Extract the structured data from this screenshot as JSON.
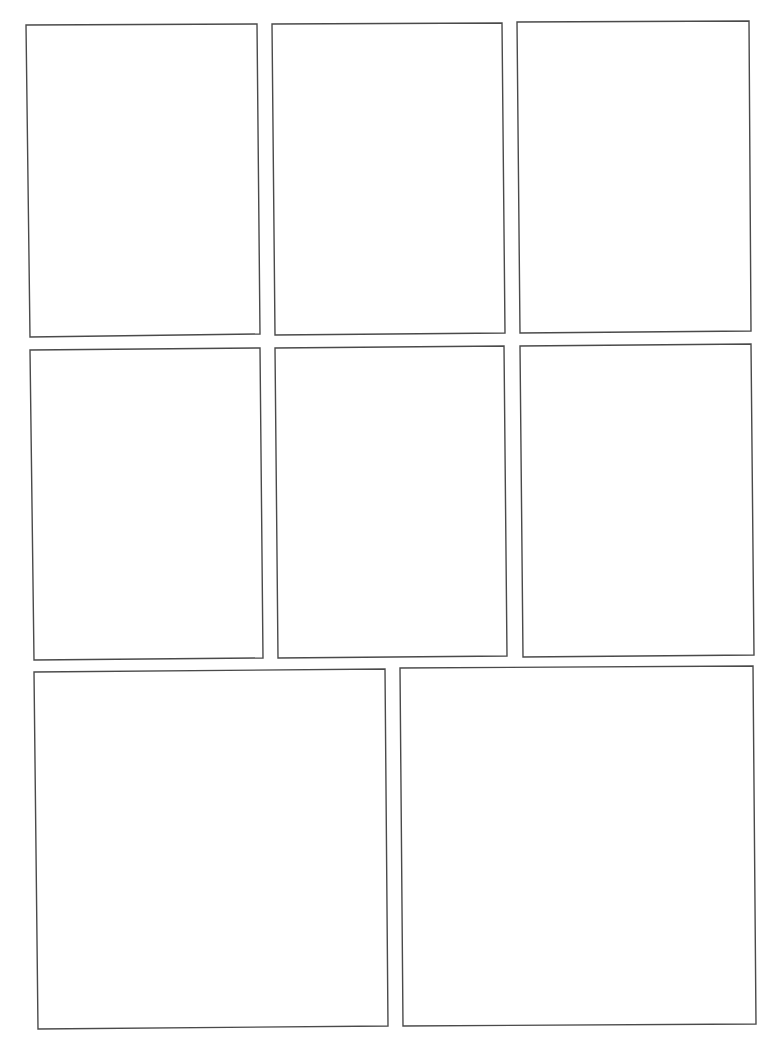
{
  "page": {
    "width": 768,
    "height": 1053,
    "background": "#ffffff",
    "border_color": "#4a4a4a",
    "type": "blank comic panel template",
    "panel_count": 8,
    "rows": 3
  },
  "panels": [
    {
      "id": 1,
      "row": 1,
      "col": 1,
      "points": [
        [
          26,
          25
        ],
        [
          257,
          24
        ],
        [
          260,
          334
        ],
        [
          30,
          337
        ]
      ]
    },
    {
      "id": 2,
      "row": 1,
      "col": 2,
      "points": [
        [
          272,
          24
        ],
        [
          502,
          23
        ],
        [
          505,
          333
        ],
        [
          275,
          335
        ]
      ]
    },
    {
      "id": 3,
      "row": 1,
      "col": 3,
      "points": [
        [
          517,
          22
        ],
        [
          749,
          21
        ],
        [
          751,
          331
        ],
        [
          520,
          333
        ]
      ]
    },
    {
      "id": 4,
      "row": 2,
      "col": 1,
      "points": [
        [
          30,
          350
        ],
        [
          260,
          348
        ],
        [
          263,
          658
        ],
        [
          34,
          660
        ]
      ]
    },
    {
      "id": 5,
      "row": 2,
      "col": 2,
      "points": [
        [
          275,
          348
        ],
        [
          504,
          346
        ],
        [
          507,
          656
        ],
        [
          278,
          658
        ]
      ]
    },
    {
      "id": 6,
      "row": 2,
      "col": 3,
      "points": [
        [
          520,
          346
        ],
        [
          751,
          344
        ],
        [
          754,
          655
        ],
        [
          523,
          657
        ]
      ]
    },
    {
      "id": 7,
      "row": 3,
      "col": 1,
      "points": [
        [
          34,
          672
        ],
        [
          385,
          669
        ],
        [
          388,
          1026
        ],
        [
          38,
          1029
        ]
      ]
    },
    {
      "id": 8,
      "row": 3,
      "col": 2,
      "points": [
        [
          400,
          668
        ],
        [
          753,
          666
        ],
        [
          756,
          1024
        ],
        [
          403,
          1026
        ]
      ]
    }
  ]
}
